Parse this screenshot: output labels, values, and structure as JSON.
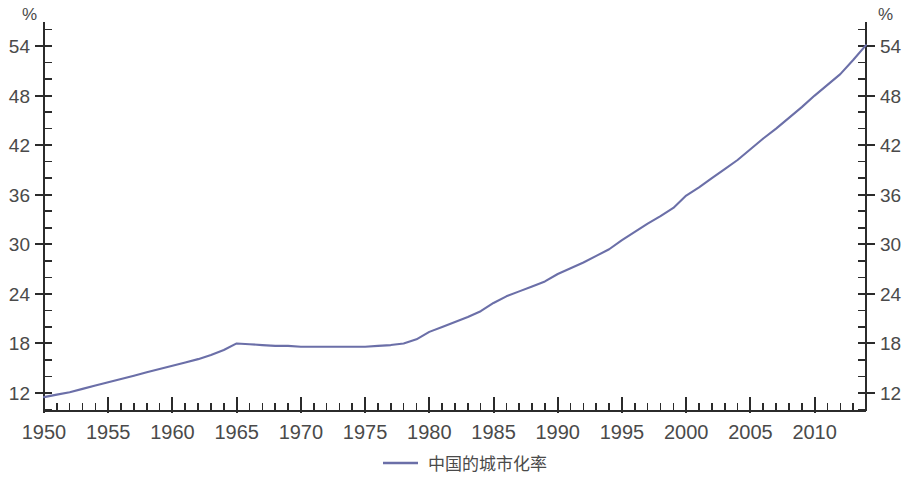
{
  "chart_data": {
    "type": "line",
    "title": "",
    "xlabel": "",
    "ylabel": "%",
    "y_unit_left": "%",
    "y_unit_right": "%",
    "xlim": [
      1950,
      2014
    ],
    "ylim": [
      10,
      56
    ],
    "grid": false,
    "legend_position": "bottom",
    "x_tick_labels": [
      "1950",
      "1955",
      "1960",
      "1965",
      "1970",
      "1975",
      "1980",
      "1985",
      "1990",
      "1995",
      "2000",
      "2005",
      "2010"
    ],
    "x_tick_values": [
      1950,
      1955,
      1960,
      1965,
      1970,
      1975,
      1980,
      1985,
      1990,
      1995,
      2000,
      2005,
      2010
    ],
    "x_minor_step": 1,
    "y_tick_labels": [
      "12",
      "18",
      "24",
      "30",
      "36",
      "42",
      "48",
      "54"
    ],
    "y_tick_values": [
      12,
      18,
      24,
      30,
      36,
      42,
      48,
      54
    ],
    "y_minor_step": 2,
    "series": [
      {
        "name": "中国的城市化率",
        "color": "#6b6fa8",
        "x": [
          1950,
          1951,
          1952,
          1953,
          1954,
          1955,
          1956,
          1957,
          1958,
          1959,
          1960,
          1961,
          1962,
          1963,
          1964,
          1965,
          1966,
          1967,
          1968,
          1969,
          1970,
          1971,
          1972,
          1973,
          1974,
          1975,
          1976,
          1977,
          1978,
          1979,
          1980,
          1981,
          1982,
          1983,
          1984,
          1985,
          1986,
          1987,
          1988,
          1989,
          1990,
          1991,
          1992,
          1993,
          1994,
          1995,
          1996,
          1997,
          1998,
          1999,
          2000,
          2001,
          2002,
          2003,
          2004,
          2005,
          2006,
          2007,
          2008,
          2009,
          2010,
          2011,
          2012,
          2013,
          2014
        ],
        "values": [
          11.5,
          11.8,
          12.1,
          12.5,
          12.9,
          13.3,
          13.7,
          14.1,
          14.5,
          14.9,
          15.3,
          15.7,
          16.1,
          16.6,
          17.2,
          18.0,
          17.9,
          17.8,
          17.7,
          17.7,
          17.6,
          17.6,
          17.6,
          17.6,
          17.6,
          17.6,
          17.7,
          17.8,
          18.0,
          18.5,
          19.4,
          20.0,
          20.6,
          21.2,
          21.9,
          22.9,
          23.7,
          24.3,
          24.9,
          25.5,
          26.4,
          27.1,
          27.8,
          28.6,
          29.4,
          30.5,
          31.5,
          32.5,
          33.4,
          34.4,
          35.9,
          36.9,
          38.0,
          39.1,
          40.2,
          41.5,
          42.8,
          44.0,
          45.3,
          46.6,
          48.0,
          49.3,
          50.6,
          52.3,
          54.1
        ]
      }
    ]
  },
  "legend": {
    "entries": [
      {
        "label": "中国的城市化率",
        "color": "#6b6fa8"
      }
    ]
  },
  "axes": {
    "left_unit": "%",
    "right_unit": "%"
  }
}
